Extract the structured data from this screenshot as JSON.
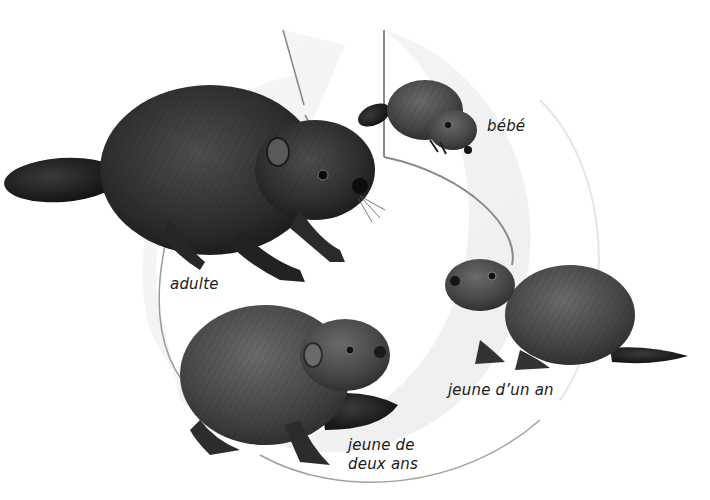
{
  "diagram": {
    "type": "life-cycle",
    "flow_direction": "clockwise",
    "stages": [
      {
        "id": "bebe",
        "label": "bébé",
        "position": "top-right"
      },
      {
        "id": "jeune-un-an",
        "label": "jeune d’un an",
        "position": "right"
      },
      {
        "id": "jeune-deux-ans",
        "label": "jeune de\ndeux ans",
        "position": "bottom"
      },
      {
        "id": "adulte",
        "label": "adulte",
        "position": "left"
      }
    ]
  },
  "colors": {
    "background": "#ffffff",
    "arrow_fill": "#f3f3f3",
    "arrow_edge": "#9a9a9a",
    "fur_dark": "#2a2a2a",
    "fur_mid": "#4a4a4a",
    "fur_light": "#6e6e6e",
    "tail": "#1c1c1c",
    "label_text": "#1a1a1a"
  }
}
